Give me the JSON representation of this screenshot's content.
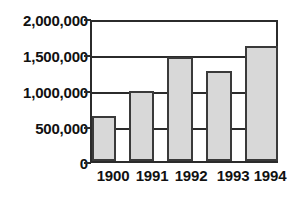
{
  "chart_data": {
    "type": "bar",
    "title": "",
    "subtitle": "",
    "xlabel": "",
    "ylabel": "",
    "categories": [
      "1900",
      "1991",
      "1992",
      "1993",
      "1994"
    ],
    "values": [
      650000,
      1000000,
      1500000,
      1300000,
      1650000
    ],
    "series": [
      {
        "name": "",
        "values": [
          650000,
          1000000,
          1500000,
          1300000,
          1650000
        ]
      }
    ],
    "ylim": [
      0,
      2000000
    ],
    "y_ticks": [
      0,
      500000,
      1000000,
      1500000,
      2000000
    ],
    "y_tick_labels": [
      "0",
      "500,000",
      "1,000,000",
      "1,500,000",
      "2,000,000"
    ],
    "grid": true,
    "gridlines_drawn_at": [
      1000000,
      1500000,
      2000000
    ],
    "legend": null,
    "legend_position": "none",
    "annotations": [],
    "colors": {
      "bar_fill": "#d8d8d8",
      "bar_outline": "#3a3a3a",
      "axis": "#2b2b2b",
      "text": "#111111",
      "background": "#ffffff"
    }
  },
  "axes": {
    "y_labels": [
      {
        "text": "2,000,000",
        "value": 2000000
      },
      {
        "text": "1,500,000",
        "value": 1500000
      },
      {
        "text": "1,000,000",
        "value": 1000000
      },
      {
        "text": "500,000",
        "value": 500000
      },
      {
        "text": "0",
        "value": 0
      }
    ],
    "x_labels": [
      {
        "text": "1900"
      },
      {
        "text": "1991"
      },
      {
        "text": "1992"
      },
      {
        "text": "1993"
      },
      {
        "text": "1994"
      }
    ]
  }
}
